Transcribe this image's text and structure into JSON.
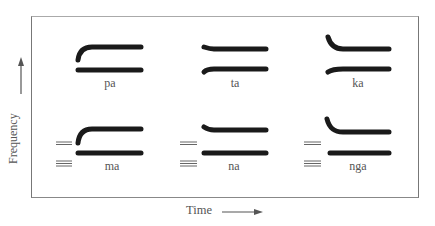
{
  "diagram": {
    "type": "schematic spectrogram formant transitions",
    "y_axis_label": "Frequency",
    "x_axis_label": "Time",
    "colors": {
      "formant": "#1a1a1a",
      "frame": "#777777",
      "murmur": "#666666",
      "text": "#555555"
    },
    "syllables": [
      {
        "label": "pa",
        "row": 1,
        "col": 1,
        "f2_onset": "rising",
        "nasal_murmur": false
      },
      {
        "label": "ta",
        "row": 1,
        "col": 2,
        "f2_onset": "slightly falling",
        "nasal_murmur": false
      },
      {
        "label": "ka",
        "row": 1,
        "col": 3,
        "f2_onset": "falling from high",
        "nasal_murmur": false
      },
      {
        "label": "ma",
        "row": 2,
        "col": 1,
        "f2_onset": "rising",
        "nasal_murmur": true
      },
      {
        "label": "na",
        "row": 2,
        "col": 2,
        "f2_onset": "slightly falling",
        "nasal_murmur": true
      },
      {
        "label": "nga",
        "row": 2,
        "col": 3,
        "f2_onset": "falling from high",
        "nasal_murmur": true
      }
    ]
  }
}
